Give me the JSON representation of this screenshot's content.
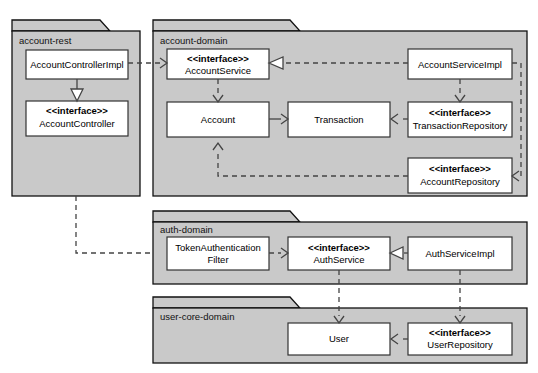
{
  "diagram": {
    "type": "uml-package-diagram",
    "canvas": {
      "width": 538,
      "height": 373
    },
    "colors": {
      "package_fill": "#c9c9c9",
      "package_stroke": "#111111",
      "class_fill": "#ffffff",
      "class_stroke": "#333333",
      "edge": "#444444",
      "background": "#ffffff"
    },
    "stereotype_interface": "<<interface>>"
  },
  "packages": [
    {
      "id": "account-rest",
      "label": "account-rest"
    },
    {
      "id": "account-domain",
      "label": "account-domain"
    },
    {
      "id": "auth-domain",
      "label": "auth-domain"
    },
    {
      "id": "user-core-domain",
      "label": "user-core-domain"
    }
  ],
  "classes": [
    {
      "id": "account-controller-impl",
      "package": "account-rest",
      "stereotype": "",
      "name": "AccountControllerImpl"
    },
    {
      "id": "account-controller",
      "package": "account-rest",
      "stereotype": "<<interface>>",
      "name": "AccountController"
    },
    {
      "id": "account-service",
      "package": "account-domain",
      "stereotype": "<<interface>>",
      "name": "AccountService"
    },
    {
      "id": "account",
      "package": "account-domain",
      "stereotype": "",
      "name": "Account"
    },
    {
      "id": "transaction",
      "package": "account-domain",
      "stereotype": "",
      "name": "Transaction"
    },
    {
      "id": "account-service-impl",
      "package": "account-domain",
      "stereotype": "",
      "name": "AccountServiceImpl"
    },
    {
      "id": "transaction-repository",
      "package": "account-domain",
      "stereotype": "<<interface>>",
      "name": "TransactionRepository"
    },
    {
      "id": "account-repository",
      "package": "account-domain",
      "stereotype": "<<interface>>",
      "name": "AccountRepository"
    },
    {
      "id": "token-authentication-filter",
      "package": "auth-domain",
      "stereotype": "",
      "name_line1": "TokenAuthentication",
      "name_line2": "Filter"
    },
    {
      "id": "auth-service",
      "package": "auth-domain",
      "stereotype": "<<interface>>",
      "name": "AuthService"
    },
    {
      "id": "auth-service-impl",
      "package": "auth-domain",
      "stereotype": "",
      "name": "AuthServiceImpl"
    },
    {
      "id": "user",
      "package": "user-core-domain",
      "stereotype": "",
      "name": "User"
    },
    {
      "id": "user-repository",
      "package": "user-core-domain",
      "stereotype": "<<interface>>",
      "name": "UserRepository"
    }
  ],
  "edges": [
    {
      "from": "account-controller-impl",
      "to": "account-service",
      "style": "dashed",
      "head": "open"
    },
    {
      "from": "account-controller-impl",
      "to": "account-controller",
      "style": "solid",
      "head": "hollow-triangle"
    },
    {
      "from": "account-service",
      "to": "account",
      "style": "dashed",
      "head": "open"
    },
    {
      "from": "account",
      "to": "transaction",
      "style": "solid",
      "head": "open"
    },
    {
      "from": "account-service-impl",
      "to": "account-service",
      "style": "dashed",
      "head": "hollow-triangle"
    },
    {
      "from": "account-service-impl",
      "to": "transaction-repository",
      "style": "dashed",
      "head": "open"
    },
    {
      "from": "account-service-impl",
      "to": "account-repository",
      "style": "dashed",
      "head": "open"
    },
    {
      "from": "transaction-repository",
      "to": "transaction",
      "style": "dashed",
      "head": "open"
    },
    {
      "from": "account-repository",
      "to": "account",
      "style": "dashed",
      "head": "open"
    },
    {
      "from": "account-rest",
      "to": "token-authentication-filter",
      "style": "dashed",
      "head": "open"
    },
    {
      "from": "token-authentication-filter",
      "to": "auth-service",
      "style": "dashed",
      "head": "open"
    },
    {
      "from": "auth-service-impl",
      "to": "auth-service",
      "style": "dashed",
      "head": "hollow-triangle"
    },
    {
      "from": "auth-service",
      "to": "user",
      "style": "dashed",
      "head": "open"
    },
    {
      "from": "auth-service-impl",
      "to": "user-repository",
      "style": "dashed",
      "head": "open"
    },
    {
      "from": "user-repository",
      "to": "user",
      "style": "dashed",
      "head": "open"
    }
  ]
}
